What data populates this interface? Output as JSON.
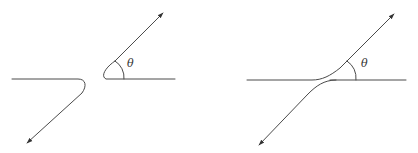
{
  "figure": {
    "panels": [
      {
        "id": "left",
        "description": "Two separated branches: a hooked curve on the left and an angled branch on the right",
        "angle_label": "θ"
      },
      {
        "id": "right",
        "description": "Two curves approaching each other, one bending up and one bending down, forming angle θ with the horizontal",
        "angle_label": "θ"
      }
    ],
    "colors": {
      "line": "#4a4a4a",
      "label": "#333333",
      "background": "#ffffff"
    },
    "icons": {
      "arrowhead": "arrowhead-icon"
    }
  }
}
